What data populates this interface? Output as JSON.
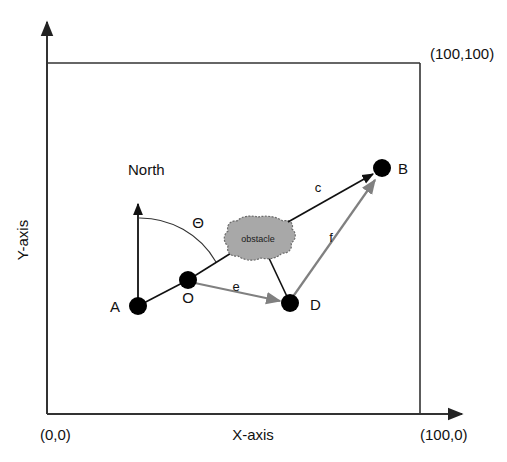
{
  "figure": {
    "title": "",
    "type": "vector-navigation-diagram",
    "background_color": "#ffffff",
    "line_color": "#333333",
    "node_color": "#000000",
    "gray_vector_color": "#808080",
    "obstacle_fill": "#a8a8a8",
    "obstacle_stroke": "#666666"
  },
  "axes": {
    "x_label": "X-axis",
    "y_label": "Y-axis",
    "origin_label": "(0,0)",
    "x_max_label": "(100,0)",
    "corner_label": "(100,100)"
  },
  "nodes": [
    {
      "id": "A",
      "label": "A",
      "x": 138,
      "y": 306,
      "label_x": 120,
      "label_y": 311
    },
    {
      "id": "O",
      "label": "O",
      "x": 188,
      "y": 280,
      "label_x": 182,
      "label_y": 302
    },
    {
      "id": "D",
      "label": "D",
      "x": 290,
      "y": 303,
      "label_x": 311,
      "label_y": 309
    },
    {
      "id": "B",
      "label": "B",
      "x": 382,
      "y": 168,
      "label_x": 398,
      "label_y": 173
    }
  ],
  "obstacle": {
    "label": "obstacle",
    "cx": 258,
    "cy": 238,
    "rx": 32,
    "ry": 21
  },
  "north": {
    "label": "North",
    "label_x": 128,
    "label_y": 175,
    "arrow_from_x": 138,
    "arrow_from_y": 306,
    "arrow_to_x": 138,
    "arrow_to_y": 202
  },
  "angle": {
    "symbol": "Θ",
    "label_x": 198,
    "label_y": 228,
    "description": "arc from North heading to O-heading"
  },
  "edges": [
    {
      "id": "AO",
      "label": "",
      "from": "A",
      "to": "O",
      "style": "plain-black",
      "arrow": false
    },
    {
      "id": "OD",
      "label": "e",
      "from": "O",
      "to": "D",
      "style": "gray",
      "arrow": true,
      "label_x": 236,
      "label_y": 290
    },
    {
      "id": "CB",
      "label": "c",
      "from": "obstacle",
      "to": "B",
      "style": "black",
      "arrow": true,
      "label_x": 318,
      "label_y": 192
    },
    {
      "id": "DB",
      "label": "f",
      "from": "D",
      "to": "B",
      "style": "gray",
      "arrow": true,
      "label_x": 331,
      "label_y": 240
    },
    {
      "id": "O-obstacle",
      "label": "",
      "from": "O",
      "to": "obstacle",
      "style": "plain-black",
      "arrow": false
    },
    {
      "id": "obstacle-D",
      "label": "",
      "from": "obstacle",
      "to": "D",
      "style": "plain-black",
      "arrow": false
    }
  ]
}
